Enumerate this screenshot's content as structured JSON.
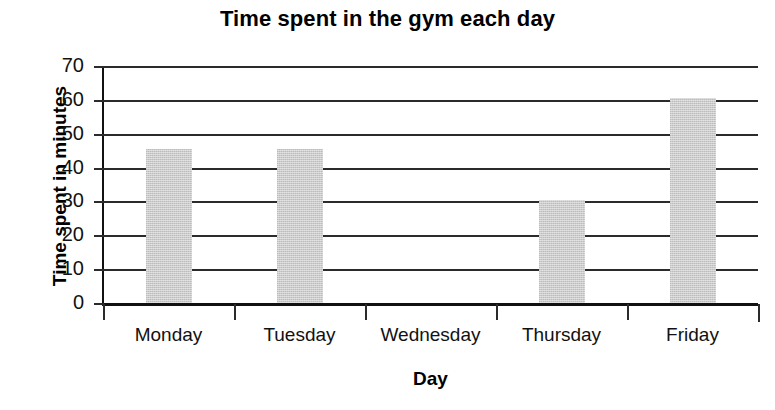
{
  "chart_data": {
    "type": "bar",
    "title": "Time spent in the gym each day",
    "xlabel": "Day",
    "ylabel": "Time spent in minutes",
    "categories": [
      "Monday",
      "Tuesday",
      "Wednesday",
      "Thursday",
      "Friday"
    ],
    "values": [
      45.5,
      45.5,
      0,
      30.5,
      60.5
    ],
    "ylim": [
      0,
      70
    ],
    "ytick_labels": [
      "0",
      "10",
      "20",
      "30",
      "40",
      "50",
      "60",
      "70"
    ],
    "ytick_values": [
      0,
      10,
      20,
      30,
      40,
      50,
      60,
      70
    ],
    "grid": "horizontal",
    "legend": "none",
    "bar_color": "#cbcbcb",
    "axis_color": "#111111",
    "background_color": "#ffffff"
  }
}
